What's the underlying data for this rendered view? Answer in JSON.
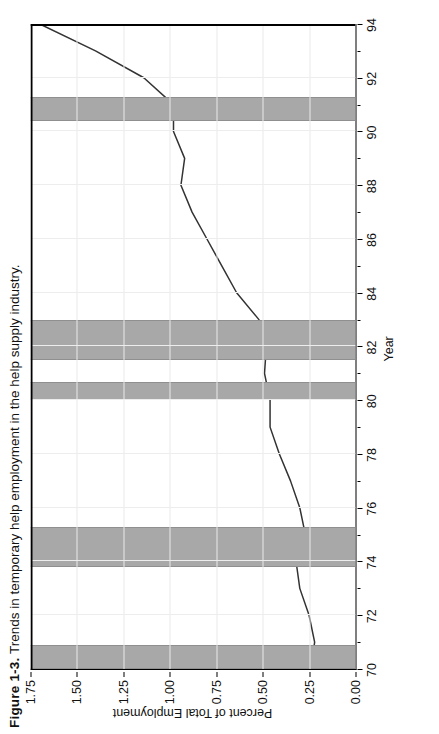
{
  "figure": {
    "number": "Figure 1-3.",
    "caption": "Trends in temporary help employment in the help supply industry."
  },
  "chart_data": {
    "type": "line",
    "title": "Trends in temporary help employment in the help supply industry.",
    "xlabel": "Year",
    "ylabel": "Percent of Total Employment",
    "xlim": [
      70,
      94
    ],
    "ylim": [
      0.0,
      1.75
    ],
    "xticks": [
      70,
      72,
      74,
      76,
      78,
      80,
      82,
      84,
      86,
      88,
      90,
      92,
      94
    ],
    "xticklabels": [
      "70",
      "72",
      "74",
      "76",
      "78",
      "80",
      "82",
      "84",
      "86",
      "88",
      "90",
      "92",
      "94"
    ],
    "yticks": [
      0.0,
      0.25,
      0.5,
      0.75,
      1.0,
      1.25,
      1.5,
      1.75
    ],
    "yticklabels": [
      "0.00",
      "0.25",
      "0.50",
      "0.75",
      "1.00",
      "1.25",
      "1.50",
      "1.75"
    ],
    "grid": true,
    "legend": "none",
    "orientation": "rotated-90-ccw",
    "line_color": "#333333",
    "band_color": "#a8a8a8",
    "x": [
      70,
      71,
      72,
      73,
      74,
      75,
      76,
      77,
      78,
      79,
      80,
      81,
      82,
      83,
      84,
      85,
      86,
      87,
      88,
      89,
      90,
      91,
      92,
      93,
      94
    ],
    "y": [
      0.24,
      0.22,
      0.25,
      0.3,
      0.32,
      0.27,
      0.3,
      0.35,
      0.41,
      0.46,
      0.46,
      0.49,
      0.48,
      0.52,
      0.64,
      0.72,
      0.8,
      0.88,
      0.94,
      0.92,
      0.98,
      0.98,
      1.14,
      1.4,
      1.7
    ],
    "series": [
      {
        "name": "Temporary help employment",
        "values": [
          0.24,
          0.22,
          0.25,
          0.3,
          0.32,
          0.27,
          0.3,
          0.35,
          0.41,
          0.46,
          0.46,
          0.49,
          0.48,
          0.52,
          0.64,
          0.72,
          0.8,
          0.88,
          0.94,
          0.92,
          0.98,
          0.98,
          1.14,
          1.4,
          1.7
        ]
      }
    ],
    "shaded_bands": {
      "name": "recession-periods",
      "color": "#a8a8a8",
      "intervals": [
        [
          69.9,
          70.8
        ],
        [
          73.8,
          75.2
        ],
        [
          80.0,
          80.6
        ],
        [
          81.5,
          82.9
        ],
        [
          90.4,
          91.2
        ]
      ]
    }
  }
}
